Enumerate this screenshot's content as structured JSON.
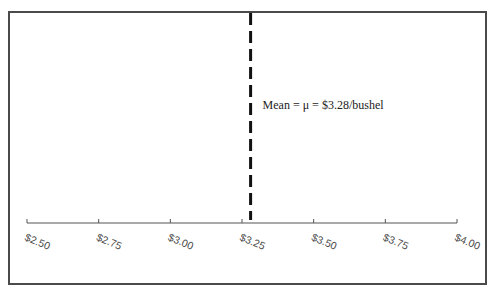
{
  "chart_data": {
    "type": "line",
    "title": "",
    "xlabel": "",
    "ylabel": "",
    "xlim": [
      2.5,
      4.0
    ],
    "ticks": [
      2.5,
      2.75,
      3.0,
      3.25,
      3.5,
      3.75,
      4.0
    ],
    "tick_labels": [
      "$2.50",
      "$2.75",
      "$3.00",
      "$3.25",
      "$3.50",
      "$3.75",
      "$4.00"
    ],
    "grid": false,
    "legend": null,
    "series": [
      {
        "name": "mean-line",
        "style": "dashed-vertical",
        "x": 3.28,
        "color": "#111111"
      }
    ],
    "annotations": [
      {
        "text": "Mean = μ = $3.28/bushel",
        "x": 3.28,
        "position": "right-of-line"
      }
    ]
  },
  "colors": {
    "frame": "#4a4a4a",
    "axis": "#555555",
    "mean_line": "#111111",
    "text": "#4a4a4a"
  }
}
